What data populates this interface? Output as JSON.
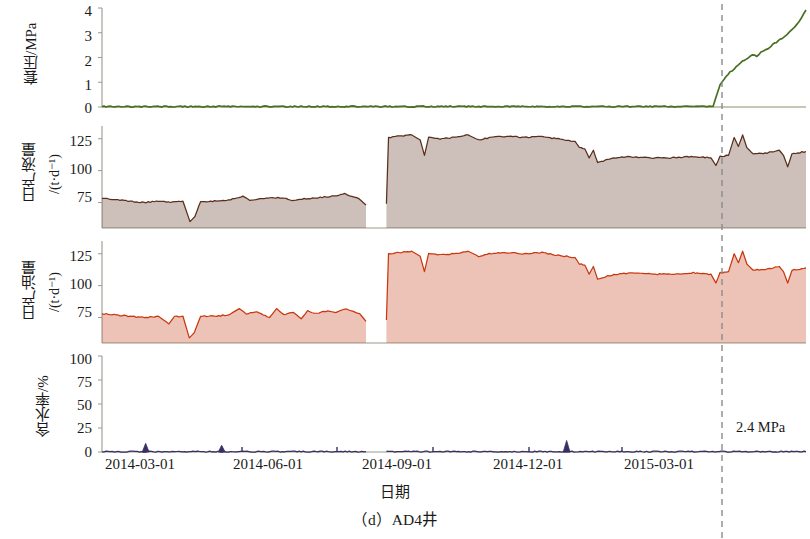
{
  "chart_data": {
    "type": "line",
    "title": "",
    "caption": "（d）AD4井",
    "xlabel": "日期",
    "x_axis": {
      "tick_labels": [
        "2014-03-01",
        "2014-06-01",
        "2014-09-01",
        "2014-12-01",
        "2015-03-01"
      ],
      "tick_positions_px": [
        140,
        235,
        331,
        427,
        520
      ],
      "range_start": "2014-01-05",
      "range_end": "2015-05-20",
      "grid": false
    },
    "annotations": [
      {
        "label": "2.4 MPa",
        "x_px": 738,
        "y_px": 428,
        "description": "casing-pressure value marked at vertical dashed reference line"
      }
    ],
    "reference_line": {
      "label": "",
      "style": "dashed",
      "color": "#8a8a8a",
      "x_px": 722,
      "date": "2015-03-25"
    },
    "panels": [
      {
        "id": "casing-pressure",
        "ylabel": "套压/MPa",
        "ylabel_main": "套压/MPa",
        "ylabel_unit": "",
        "ylim": [
          0,
          4
        ],
        "yticks": [
          0,
          1,
          2,
          3,
          4
        ],
        "color": "#4a7024",
        "fill": false,
        "series_name": "套压",
        "values": [
          {
            "x": 0.0,
            "y": 0.02
          },
          {
            "x": 0.3,
            "y": 0.02
          },
          {
            "x": 0.55,
            "y": 0.02
          },
          {
            "x": 0.7,
            "y": 0.02
          },
          {
            "x": 0.84,
            "y": 0.02
          },
          {
            "x": 0.868,
            "y": 0.03
          },
          {
            "x": 0.874,
            "y": 0.55
          },
          {
            "x": 0.878,
            "y": 0.9
          },
          {
            "x": 0.884,
            "y": 1.15
          },
          {
            "x": 0.892,
            "y": 1.4
          },
          {
            "x": 0.901,
            "y": 1.62
          },
          {
            "x": 0.91,
            "y": 1.85
          },
          {
            "x": 0.918,
            "y": 2.0
          },
          {
            "x": 0.924,
            "y": 2.12
          },
          {
            "x": 0.93,
            "y": 2.05
          },
          {
            "x": 0.936,
            "y": 2.22
          },
          {
            "x": 0.943,
            "y": 2.3
          },
          {
            "x": 0.95,
            "y": 2.46
          },
          {
            "x": 0.958,
            "y": 2.62
          },
          {
            "x": 0.966,
            "y": 2.78
          },
          {
            "x": 0.973,
            "y": 2.95
          },
          {
            "x": 0.98,
            "y": 3.12
          },
          {
            "x": 0.987,
            "y": 3.34
          },
          {
            "x": 0.993,
            "y": 3.58
          },
          {
            "x": 1.0,
            "y": 3.92
          }
        ]
      },
      {
        "id": "daily-liquid-production",
        "ylabel": "日产液量 /(t·d⁻¹)",
        "ylabel_main": "日产液量",
        "ylabel_unit": "/(t·d⁻¹)",
        "ylim": [
          55,
          135
        ],
        "yticks": [
          75,
          100,
          125
        ],
        "color": "#5a2e1c",
        "fill": true,
        "series_name": "日产液量",
        "gap_x": [
          0.379,
          0.404
        ],
        "values": [
          {
            "x": 0.0,
            "y": 78
          },
          {
            "x": 0.02,
            "y": 77
          },
          {
            "x": 0.04,
            "y": 76
          },
          {
            "x": 0.06,
            "y": 75
          },
          {
            "x": 0.08,
            "y": 76
          },
          {
            "x": 0.1,
            "y": 75
          },
          {
            "x": 0.115,
            "y": 76
          },
          {
            "x": 0.125,
            "y": 60
          },
          {
            "x": 0.132,
            "y": 64
          },
          {
            "x": 0.14,
            "y": 76
          },
          {
            "x": 0.16,
            "y": 76
          },
          {
            "x": 0.18,
            "y": 77
          },
          {
            "x": 0.2,
            "y": 80
          },
          {
            "x": 0.21,
            "y": 77
          },
          {
            "x": 0.23,
            "y": 78
          },
          {
            "x": 0.25,
            "y": 79
          },
          {
            "x": 0.27,
            "y": 77
          },
          {
            "x": 0.29,
            "y": 78
          },
          {
            "x": 0.31,
            "y": 79
          },
          {
            "x": 0.33,
            "y": 80
          },
          {
            "x": 0.345,
            "y": 82
          },
          {
            "x": 0.355,
            "y": 80
          },
          {
            "x": 0.365,
            "y": 78
          },
          {
            "x": 0.375,
            "y": 73
          },
          {
            "x": 0.404,
            "y": 74
          },
          {
            "x": 0.407,
            "y": 126
          },
          {
            "x": 0.42,
            "y": 127
          },
          {
            "x": 0.44,
            "y": 128
          },
          {
            "x": 0.452,
            "y": 124
          },
          {
            "x": 0.458,
            "y": 112
          },
          {
            "x": 0.464,
            "y": 126
          },
          {
            "x": 0.48,
            "y": 125
          },
          {
            "x": 0.5,
            "y": 126
          },
          {
            "x": 0.52,
            "y": 128
          },
          {
            "x": 0.535,
            "y": 124
          },
          {
            "x": 0.55,
            "y": 126
          },
          {
            "x": 0.575,
            "y": 127
          },
          {
            "x": 0.6,
            "y": 126
          },
          {
            "x": 0.625,
            "y": 127
          },
          {
            "x": 0.645,
            "y": 125
          },
          {
            "x": 0.66,
            "y": 124
          },
          {
            "x": 0.672,
            "y": 123
          },
          {
            "x": 0.678,
            "y": 118
          },
          {
            "x": 0.686,
            "y": 117
          },
          {
            "x": 0.692,
            "y": 110
          },
          {
            "x": 0.698,
            "y": 116
          },
          {
            "x": 0.704,
            "y": 106
          },
          {
            "x": 0.715,
            "y": 108
          },
          {
            "x": 0.73,
            "y": 110
          },
          {
            "x": 0.75,
            "y": 111
          },
          {
            "x": 0.78,
            "y": 110
          },
          {
            "x": 0.81,
            "y": 110
          },
          {
            "x": 0.84,
            "y": 111
          },
          {
            "x": 0.865,
            "y": 110
          },
          {
            "x": 0.872,
            "y": 104
          },
          {
            "x": 0.878,
            "y": 111
          },
          {
            "x": 0.89,
            "y": 112
          },
          {
            "x": 0.898,
            "y": 126
          },
          {
            "x": 0.904,
            "y": 119
          },
          {
            "x": 0.91,
            "y": 128
          },
          {
            "x": 0.916,
            "y": 118
          },
          {
            "x": 0.925,
            "y": 113
          },
          {
            "x": 0.945,
            "y": 114
          },
          {
            "x": 0.962,
            "y": 116
          },
          {
            "x": 0.968,
            "y": 112
          },
          {
            "x": 0.974,
            "y": 103
          },
          {
            "x": 0.98,
            "y": 113
          },
          {
            "x": 1.0,
            "y": 115
          }
        ]
      },
      {
        "id": "daily-oil-production",
        "ylabel": "日产油量 /(t·d⁻¹)",
        "ylabel_main": "日产油量",
        "ylabel_unit": "/(t·d⁻¹)",
        "ylim": [
          55,
          135
        ],
        "yticks": [
          75,
          100,
          125
        ],
        "color": "#c8380f",
        "fill": true,
        "series_name": "日产油量",
        "gap_x": [
          0.379,
          0.404
        ],
        "values": [
          {
            "x": 0.0,
            "y": 78
          },
          {
            "x": 0.02,
            "y": 77
          },
          {
            "x": 0.04,
            "y": 76
          },
          {
            "x": 0.06,
            "y": 75
          },
          {
            "x": 0.08,
            "y": 76
          },
          {
            "x": 0.095,
            "y": 70
          },
          {
            "x": 0.103,
            "y": 76
          },
          {
            "x": 0.115,
            "y": 76
          },
          {
            "x": 0.124,
            "y": 59
          },
          {
            "x": 0.131,
            "y": 63
          },
          {
            "x": 0.14,
            "y": 76
          },
          {
            "x": 0.16,
            "y": 76
          },
          {
            "x": 0.18,
            "y": 77
          },
          {
            "x": 0.195,
            "y": 82
          },
          {
            "x": 0.205,
            "y": 78
          },
          {
            "x": 0.22,
            "y": 79
          },
          {
            "x": 0.238,
            "y": 75
          },
          {
            "x": 0.248,
            "y": 82
          },
          {
            "x": 0.258,
            "y": 77
          },
          {
            "x": 0.272,
            "y": 79
          },
          {
            "x": 0.283,
            "y": 74
          },
          {
            "x": 0.292,
            "y": 80
          },
          {
            "x": 0.305,
            "y": 78
          },
          {
            "x": 0.318,
            "y": 80
          },
          {
            "x": 0.332,
            "y": 79
          },
          {
            "x": 0.345,
            "y": 82
          },
          {
            "x": 0.356,
            "y": 80
          },
          {
            "x": 0.366,
            "y": 78
          },
          {
            "x": 0.375,
            "y": 72
          },
          {
            "x": 0.404,
            "y": 73
          },
          {
            "x": 0.407,
            "y": 125
          },
          {
            "x": 0.42,
            "y": 126
          },
          {
            "x": 0.44,
            "y": 127
          },
          {
            "x": 0.452,
            "y": 123
          },
          {
            "x": 0.458,
            "y": 111
          },
          {
            "x": 0.464,
            "y": 125
          },
          {
            "x": 0.48,
            "y": 124
          },
          {
            "x": 0.5,
            "y": 125
          },
          {
            "x": 0.52,
            "y": 127
          },
          {
            "x": 0.535,
            "y": 123
          },
          {
            "x": 0.55,
            "y": 125
          },
          {
            "x": 0.575,
            "y": 126
          },
          {
            "x": 0.6,
            "y": 125
          },
          {
            "x": 0.625,
            "y": 126
          },
          {
            "x": 0.645,
            "y": 124
          },
          {
            "x": 0.66,
            "y": 123
          },
          {
            "x": 0.672,
            "y": 122
          },
          {
            "x": 0.678,
            "y": 117
          },
          {
            "x": 0.686,
            "y": 116
          },
          {
            "x": 0.692,
            "y": 109
          },
          {
            "x": 0.698,
            "y": 115
          },
          {
            "x": 0.704,
            "y": 105
          },
          {
            "x": 0.715,
            "y": 107
          },
          {
            "x": 0.73,
            "y": 109
          },
          {
            "x": 0.75,
            "y": 110
          },
          {
            "x": 0.78,
            "y": 109
          },
          {
            "x": 0.81,
            "y": 109
          },
          {
            "x": 0.84,
            "y": 110
          },
          {
            "x": 0.865,
            "y": 109
          },
          {
            "x": 0.872,
            "y": 102
          },
          {
            "x": 0.878,
            "y": 110
          },
          {
            "x": 0.89,
            "y": 111
          },
          {
            "x": 0.898,
            "y": 125
          },
          {
            "x": 0.904,
            "y": 118
          },
          {
            "x": 0.91,
            "y": 127
          },
          {
            "x": 0.916,
            "y": 117
          },
          {
            "x": 0.925,
            "y": 112
          },
          {
            "x": 0.945,
            "y": 113
          },
          {
            "x": 0.962,
            "y": 115
          },
          {
            "x": 0.968,
            "y": 111
          },
          {
            "x": 0.974,
            "y": 102
          },
          {
            "x": 0.98,
            "y": 112
          },
          {
            "x": 1.0,
            "y": 114
          }
        ]
      },
      {
        "id": "water-cut",
        "ylabel": "含水率/%",
        "ylabel_main": "含水率/%",
        "ylabel_unit": "",
        "ylim": [
          0,
          100
        ],
        "yticks": [
          0,
          25,
          50,
          75,
          100
        ],
        "color": "#3a2f63",
        "fill": true,
        "series_name": "含水率",
        "gap_x": [
          0.379,
          0.404
        ],
        "spikes": [
          {
            "x": 0.062,
            "y": 9
          },
          {
            "x": 0.17,
            "y": 7
          },
          {
            "x": 0.66,
            "y": 12
          }
        ],
        "values": [
          {
            "x": 0.0,
            "y": 0.4
          },
          {
            "x": 0.05,
            "y": 0.4
          },
          {
            "x": 0.2,
            "y": 0.4
          },
          {
            "x": 0.375,
            "y": 0.4
          },
          {
            "x": 0.404,
            "y": 0.4
          },
          {
            "x": 0.6,
            "y": 0.4
          },
          {
            "x": 0.8,
            "y": 0.4
          },
          {
            "x": 1.0,
            "y": 0.4
          }
        ]
      }
    ]
  }
}
